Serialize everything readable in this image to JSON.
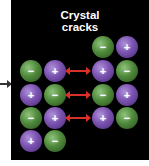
{
  "diagram": {
    "title_line1": "Crystal",
    "title_line2": "cracks",
    "colors": {
      "background": "#000000",
      "positive_ion": "#7a52b0",
      "negative_ion": "#4f8a3c",
      "repulsion_arrow": "#d8312a"
    },
    "left_block": [
      [
        "−",
        "+"
      ],
      [
        "+",
        "−"
      ],
      [
        "−",
        "+"
      ],
      [
        "+",
        "−"
      ]
    ],
    "right_block": [
      [
        "−",
        "+"
      ],
      [
        "+",
        "−"
      ],
      [
        "−",
        "+"
      ],
      [
        "+",
        "−"
      ]
    ],
    "repulsion_arrows": 3
  }
}
